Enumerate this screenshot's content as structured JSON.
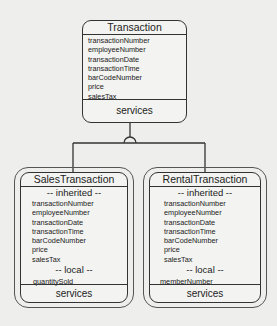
{
  "parent": {
    "title": "Transaction",
    "attributes": [
      "transactionNumber",
      "employeeNumber",
      "transactionDate",
      "transactionTime",
      "barCodeNumber",
      "price",
      "salesTax"
    ],
    "services_label": "services"
  },
  "children": [
    {
      "title": "SalesTransaction",
      "inherited_label": "-- inherited --",
      "inherited": [
        "transactionNumber",
        "employeeNumber",
        "transactionDate",
        "transactionTime",
        "barCodeNumber",
        "price",
        "salesTax"
      ],
      "local_label": "-- local --",
      "local": [
        "quantitySold"
      ],
      "services_label": "services"
    },
    {
      "title": "RentalTransaction",
      "inherited_label": "-- inherited --",
      "inherited": [
        "transactionNumber",
        "employeeNumber",
        "transactionDate",
        "transactionTime",
        "barCodeNumber",
        "price",
        "salesTax"
      ],
      "local_label": "-- local --",
      "local": [
        "memberNumber"
      ],
      "services_label": "services"
    }
  ]
}
